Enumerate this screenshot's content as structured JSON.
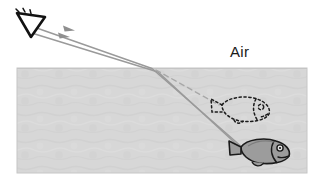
{
  "figure": {
    "width": 320,
    "height": 177,
    "background_color": "#ffffff"
  },
  "labels": {
    "air": "Air"
  },
  "colors": {
    "water_fill": "#d6d6d6",
    "water_edge": "#c2c2c2",
    "ray_stroke": "#9a9a9a",
    "dashed_ray_stroke": "#a6a6a6",
    "eye_outline": "#111111",
    "fish_outline": "#1a1a1a",
    "fish_fill": "#9c9c9c",
    "apparent_fish_outline": "#1a1a1a",
    "text_color": "#1a1a1a"
  },
  "regions": {
    "water": {
      "name": "water",
      "x": 17,
      "y": 68,
      "width": 290,
      "height": 105
    },
    "air": {
      "name": "air",
      "x": 0,
      "y": 0,
      "width": 320,
      "height": 68
    }
  },
  "objects": {
    "eye": {
      "name": "eye",
      "x": 25,
      "y": 22
    },
    "real_fish": {
      "name": "real-fish",
      "x": 248,
      "y": 151,
      "facing": "right"
    },
    "apparent_fish": {
      "name": "apparent-fish-image",
      "x": 240,
      "y": 110,
      "style": "dashed"
    }
  },
  "rays": {
    "upper": {
      "name": "upper-light-ray",
      "points": "243,148 152,68 31,26",
      "arrow_at": "72,30"
    },
    "lower": {
      "name": "lower-light-ray",
      "points": "245,152 158,72 30,32",
      "arrow_at": "66,37"
    },
    "virtual": {
      "name": "virtual-ray-dashed",
      "points": "156,71 218,105"
    }
  }
}
